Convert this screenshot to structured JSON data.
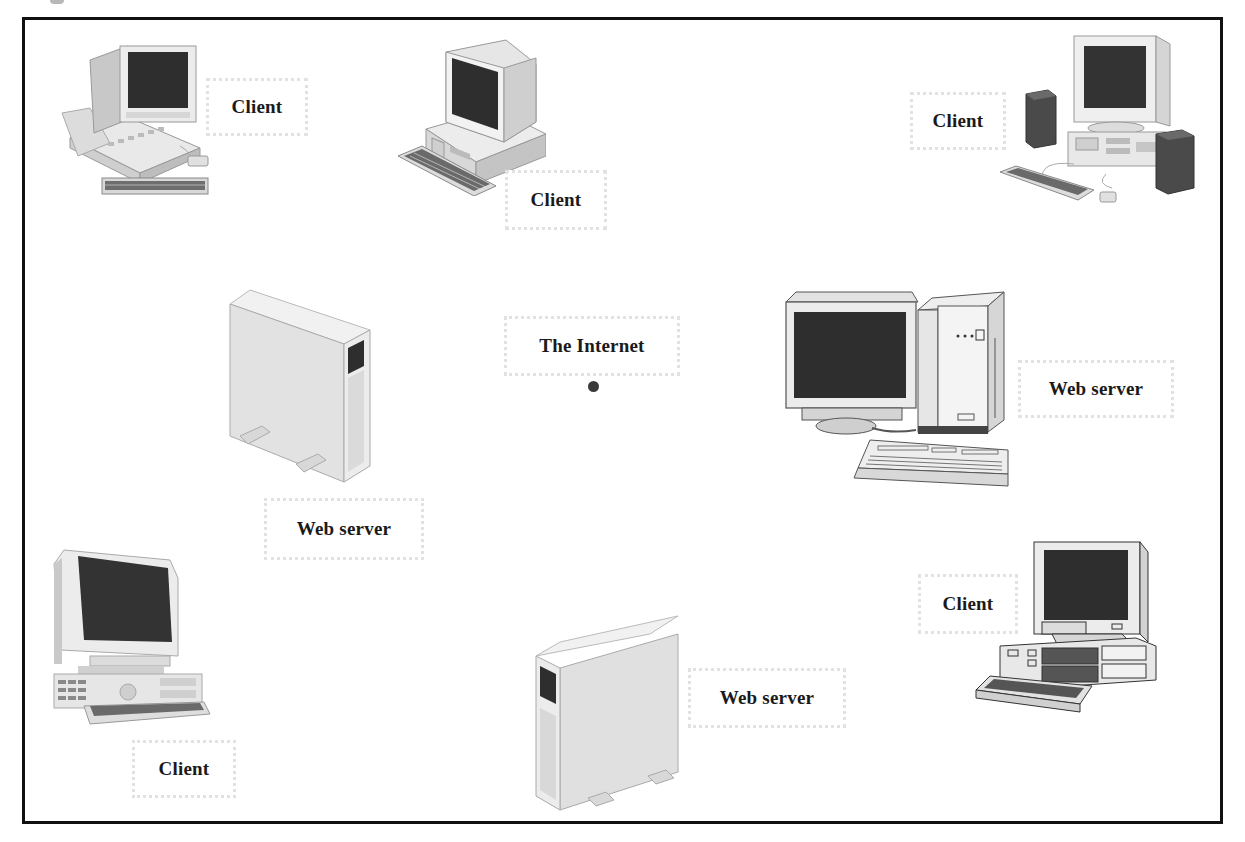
{
  "diagram": {
    "type": "network-topology",
    "colors": {
      "frame": "#111111",
      "label_border": "#e2e2e2",
      "label_text": "#1a1a1a",
      "screen": "#2e2e2e",
      "case": "#e6e6e6",
      "hub": "#3a3a3a"
    },
    "hub": {
      "label": "The Internet",
      "icon": "hub-dot"
    },
    "nodes": [
      {
        "id": "client-1",
        "role": "client",
        "label": "Client",
        "icon": "desktop-computer-icon"
      },
      {
        "id": "client-2",
        "role": "client",
        "label": "Client",
        "icon": "desktop-computer-icon"
      },
      {
        "id": "client-3",
        "role": "client",
        "label": "Client",
        "icon": "desktop-computer-speakers-icon"
      },
      {
        "id": "server-1",
        "role": "web-server",
        "label": "Web server",
        "icon": "tower-server-icon"
      },
      {
        "id": "server-2",
        "role": "web-server",
        "label": "Web server",
        "icon": "workstation-server-icon"
      },
      {
        "id": "client-4",
        "role": "client",
        "label": "Client",
        "icon": "desktop-computer-icon"
      },
      {
        "id": "client-5",
        "role": "client",
        "label": "Client",
        "icon": "desktop-computer-icon"
      },
      {
        "id": "server-3",
        "role": "web-server",
        "label": "Web server",
        "icon": "tower-server-icon"
      }
    ]
  }
}
